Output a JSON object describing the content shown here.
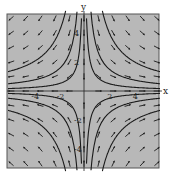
{
  "chart_data": {
    "type": "vector-field",
    "title": "",
    "xlabel": "x",
    "ylabel": "y",
    "xlim": [
      -6,
      6
    ],
    "ylim": [
      -5.3,
      5.3
    ],
    "x_ticks": [
      -4,
      -2,
      2,
      4
    ],
    "y_ticks": [
      -4,
      -2,
      2,
      4
    ],
    "x_tick_labels": [
      "-4",
      "-2",
      "2",
      "4"
    ],
    "y_tick_labels": [
      "-4",
      "-2",
      "2",
      "4"
    ],
    "field": {
      "dx": "x",
      "dy": "-y",
      "equilibrium": [
        0,
        0
      ],
      "type": "saddle"
    },
    "trajectories": [
      {
        "c": 1
      },
      {
        "c": 3
      },
      {
        "c": 8
      },
      {
        "c": -1
      },
      {
        "c": -3
      },
      {
        "c": -8
      }
    ],
    "grid": false,
    "colors": {
      "background": "#b8b8b8",
      "line": "#1a1a1a",
      "frame": "#555555"
    }
  }
}
